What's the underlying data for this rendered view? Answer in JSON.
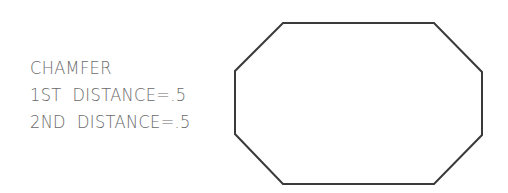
{
  "annotation": {
    "title": "CHAMFER",
    "first_distance": "1ST  DISTANCE=.5",
    "second_distance": "2ND  DISTANCE=.5"
  },
  "shape": {
    "type": "chamfered-rectangle",
    "stroke_color": "#3a3a3a",
    "points": "283,23 434,23 482,72 482,135 434,184 283,184 235,134 235,71"
  }
}
